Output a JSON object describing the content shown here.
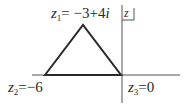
{
  "diagram": {
    "plane_label": "z",
    "points": [
      {
        "name": "z1",
        "var": "z",
        "sub": "1",
        "value": "= −3+4",
        "imag": "i",
        "x": -3,
        "y": 4
      },
      {
        "name": "z2",
        "var": "z",
        "sub": "2",
        "value": "=−6",
        "x": -6,
        "y": 0
      },
      {
        "name": "z3",
        "var": "z",
        "sub": "3",
        "value": "=0",
        "x": 0,
        "y": 0
      }
    ],
    "colors": {
      "stroke": "#2a2a2a",
      "axis": "#555555",
      "background": "#ffffff"
    }
  }
}
